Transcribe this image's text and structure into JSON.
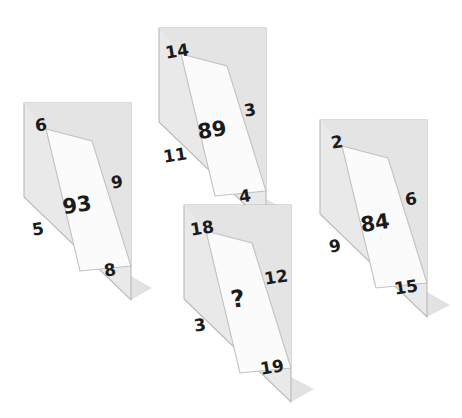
{
  "puzzle": {
    "background_color": "#ffffff",
    "panel_fill": "#e9e9e9",
    "panel_fill_dark": "#e0e0e0",
    "inner_fill": "#fbfbfb",
    "stroke_color": "#b9b9b9",
    "shadow_color": "#e2e2e2",
    "text_color": "#1b1b1b",
    "unknown_marker": "?",
    "shapes": [
      {
        "id": "shape-left",
        "center": "93",
        "corners": {
          "top": "6",
          "right": "9",
          "left": "5",
          "bottom": "8"
        }
      },
      {
        "id": "shape-top",
        "center": "89",
        "corners": {
          "top": "14",
          "right": "3",
          "left": "11",
          "bottom": "4"
        }
      },
      {
        "id": "shape-bottom",
        "center": "?",
        "corners": {
          "top": "18",
          "right": "12",
          "left": "3",
          "bottom": "19"
        }
      },
      {
        "id": "shape-right",
        "center": "84",
        "corners": {
          "top": "2",
          "right": "6",
          "left": "9",
          "bottom": "15"
        }
      }
    ]
  }
}
